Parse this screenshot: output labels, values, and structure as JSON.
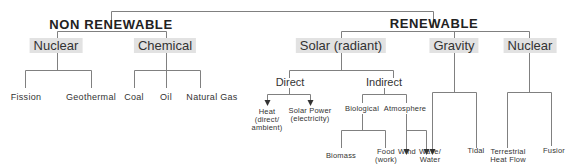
{
  "diagram": {
    "title_left": "NON RENEWABLE",
    "title_right": "RENEWABLE",
    "non_renewable": {
      "nuclear": {
        "label": "Nuclear",
        "children": [
          "Fission",
          "Geothermal"
        ]
      },
      "chemical": {
        "label": "Chemical",
        "children": [
          "Coal",
          "Oil",
          "Natural Gas"
        ]
      }
    },
    "renewable": {
      "solar": {
        "label": "Solar (radiant)",
        "direct": {
          "label": "Direct",
          "children": [
            "Heat\n(direct/\nambient)",
            "Solar Power\n(electricity)"
          ]
        },
        "indirect": {
          "label": "Indirect",
          "biological": {
            "label": "Biological",
            "children": [
              "Biomass",
              "Food\n(work)"
            ]
          },
          "atmosphere": {
            "label": "Atmosphere",
            "children": [
              "Wind",
              "Wave/\nWater"
            ]
          }
        }
      },
      "gravity": {
        "label": "Gravity",
        "children": [
          "Wave/\nWater",
          "Tidal"
        ]
      },
      "nuclear": {
        "label": "Nuclear",
        "children": [
          "Terrestrial\nHeat Flow",
          "Fusion"
        ]
      }
    },
    "labels": {
      "heat_l1": "Heat",
      "heat_l2": "(direct/",
      "heat_l3": "ambient)",
      "solarpower_l1": "Solar Power",
      "solarpower_l2": "(electricity)",
      "food_l1": "Food",
      "food_l2": "(work)",
      "wave_l1": "Wave/",
      "wave_l2": "Water",
      "terr_l1": "Terrestrial",
      "terr_l2": "Heat Flow",
      "fusion": "Fusior"
    },
    "colors": {
      "line": "#777777",
      "box": "#e2e2e2",
      "text": "#333333"
    }
  }
}
